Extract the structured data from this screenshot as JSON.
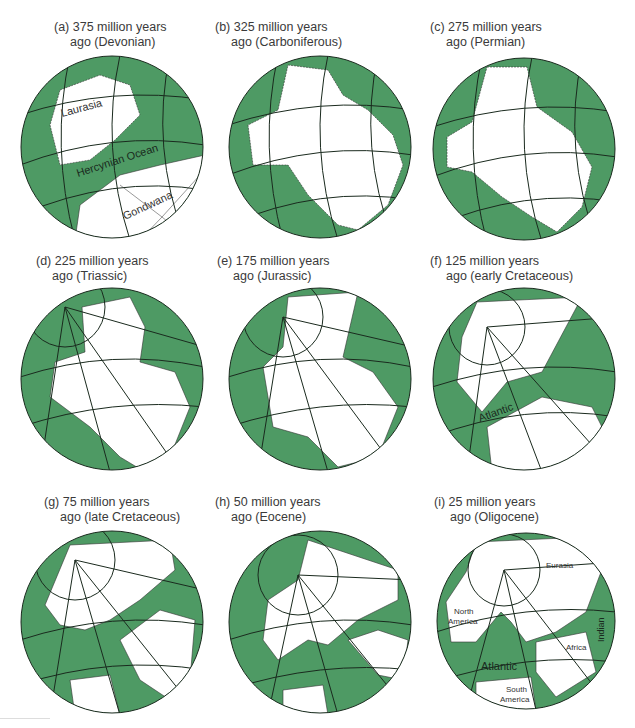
{
  "figure": {
    "colors": {
      "ocean": "#4e9a64",
      "land": "#ffffff",
      "grid": "#1a2a1e",
      "coast": "#222222"
    },
    "panels": [
      {
        "id": "a",
        "line1": "(a) 375 million years",
        "line2": "ago (Devonian)",
        "labels": [
          "Laurasia",
          "Hercynian Ocean",
          "Gondwana"
        ]
      },
      {
        "id": "b",
        "line1": "(b) 325 million years",
        "line2": "ago (Carboniferous)",
        "labels": []
      },
      {
        "id": "c",
        "line1": "(c) 275 million years",
        "line2": "ago (Permian)",
        "labels": []
      },
      {
        "id": "d",
        "line1": "(d) 225 million years",
        "line2": "ago (Triassic)",
        "labels": []
      },
      {
        "id": "e",
        "line1": "(e) 175 million years",
        "line2": "ago (Jurassic)",
        "labels": []
      },
      {
        "id": "f",
        "line1": "(f) 125 million years",
        "line2": "ago (early Cretaceous)",
        "labels": [
          "Atlantic"
        ]
      },
      {
        "id": "g",
        "line1": "(g) 75 million years",
        "line2": "ago (late Cretaceous)",
        "labels": []
      },
      {
        "id": "h",
        "line1": "(h) 50 million years",
        "line2": "ago (Eocene)",
        "labels": []
      },
      {
        "id": "i",
        "line1": "(i) 25 million years",
        "line2": "ago (Oligocene)",
        "labels": [
          "Eurasia",
          "North America",
          "Africa",
          "Indian",
          "Atlantic",
          "South America"
        ]
      }
    ]
  }
}
